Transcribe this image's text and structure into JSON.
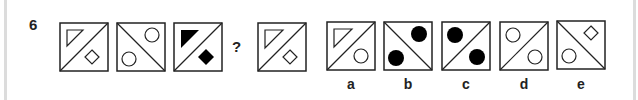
{
  "question": {
    "number": "6",
    "missing_marker": "?"
  },
  "sequence": [
    {
      "diagonal": "bl-tr",
      "top_shape": "triangle-outline",
      "bottom_shape": "diamond-outline"
    },
    {
      "diagonal": "tl-br",
      "top_shape": "circle-outline",
      "bottom_shape": "circle-outline"
    },
    {
      "diagonal": "bl-tr",
      "top_shape": "triangle-filled",
      "bottom_shape": "diamond-filled"
    },
    {
      "diagonal": "bl-tr",
      "top_shape": "triangle-outline",
      "bottom_shape": "diamond-outline"
    }
  ],
  "options": [
    {
      "label": "a",
      "diagonal": "bl-tr",
      "top_shape": "triangle-outline",
      "bottom_shape": "circle-outline"
    },
    {
      "label": "b",
      "diagonal": "tl-br",
      "top_shape": "circle-filled",
      "bottom_shape": "circle-filled"
    },
    {
      "label": "c",
      "diagonal": "bl-tr",
      "top_shape": "circle-filled",
      "bottom_shape": "circle-filled"
    },
    {
      "label": "d",
      "diagonal": "bl-tr",
      "top_shape": "circle-outline",
      "bottom_shape": "circle-outline"
    },
    {
      "label": "e",
      "diagonal": "tl-br",
      "top_shape": "diamond-outline",
      "bottom_shape": "circle-outline"
    }
  ],
  "colors": {
    "stroke": "#222222",
    "fill": "#000000",
    "border_rule": "#dcdcdc"
  }
}
